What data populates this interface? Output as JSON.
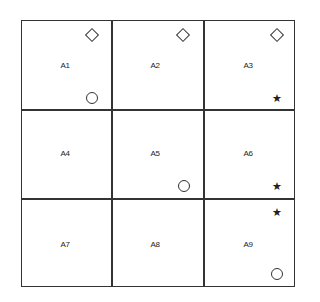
{
  "grid": {
    "rows": 3,
    "cols": 3,
    "cells": [
      {
        "label": "A1",
        "symbols": [
          "diamond-top-right",
          "circle-bottom-right"
        ]
      },
      {
        "label": "A2",
        "symbols": [
          "diamond-top-right"
        ]
      },
      {
        "label": "A3",
        "symbols": [
          "diamond-top-right",
          "star-bottom-right"
        ]
      },
      {
        "label": "A4",
        "symbols": []
      },
      {
        "label": "A5",
        "symbols": [
          "circle-bottom-right"
        ]
      },
      {
        "label": "A6",
        "symbols": [
          "star-bottom-right"
        ]
      },
      {
        "label": "A7",
        "symbols": []
      },
      {
        "label": "A8",
        "symbols": []
      },
      {
        "label": "A9",
        "symbols": [
          "star-top-right",
          "circle-bottom-right"
        ]
      }
    ]
  },
  "symbols": {
    "star": "★"
  }
}
